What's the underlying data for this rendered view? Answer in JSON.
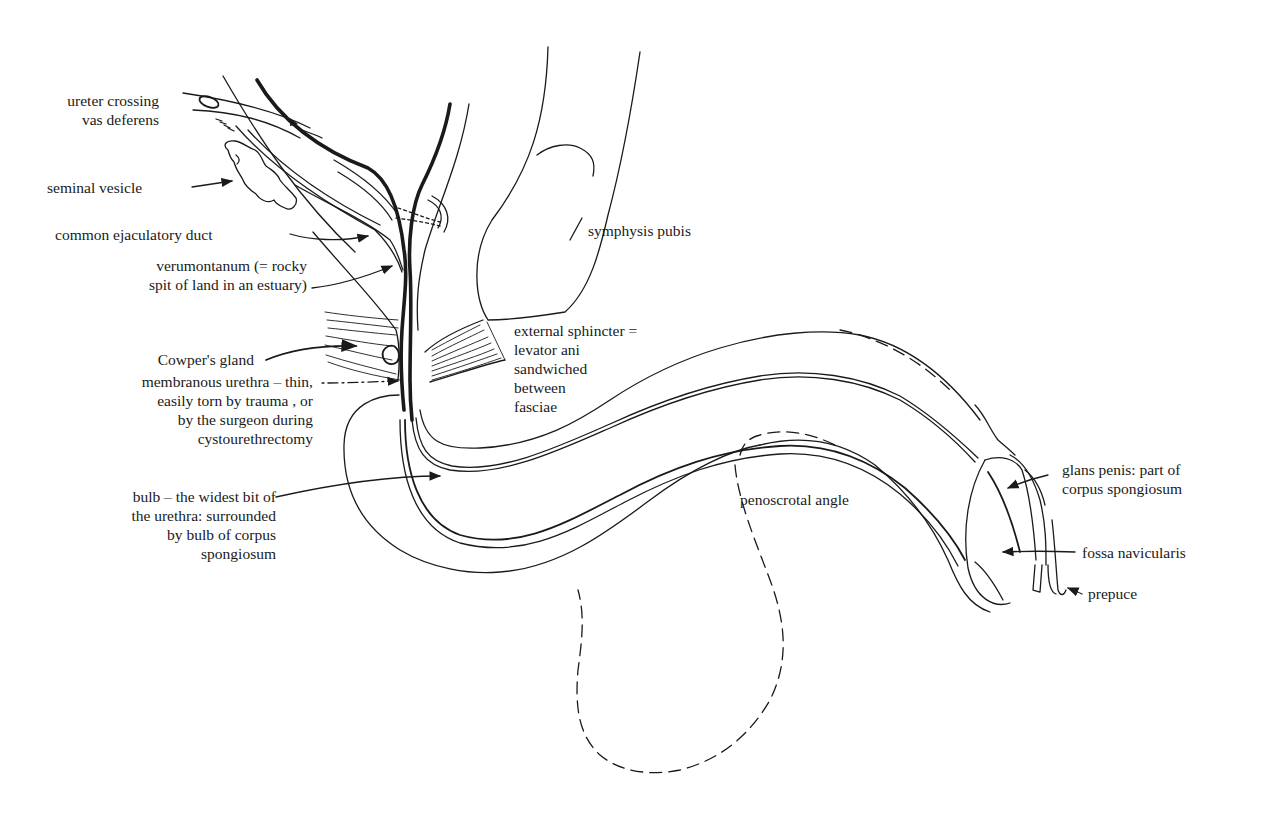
{
  "figure": {
    "labels": {
      "ureter_crossing": [
        "ureter crossing",
        "vas deferens"
      ],
      "seminal_vesicle": [
        "seminal vesicle"
      ],
      "common_ejaculatory_duct": [
        "common ejaculatory duct"
      ],
      "verumontanum": [
        "verumontanum (= rocky",
        "spit of land in an estuary)"
      ],
      "cowpers_gland": [
        "Cowper's gland"
      ],
      "membranous_urethra": [
        "membranous urethra – thin,",
        "easily torn by trauma , or",
        "by the surgeon during",
        "cystourethrectomy"
      ],
      "bulb": [
        "bulb – the widest bit of",
        "the urethra: surrounded",
        "by bulb of corpus",
        "spongiosum"
      ],
      "symphysis_pubis": [
        "symphysis pubis"
      ],
      "external_sphincter": [
        "external sphincter =",
        "levator ani",
        "sandwiched",
        "between",
        "fasciae"
      ],
      "penoscrotal_angle": [
        "penoscrotal angle"
      ],
      "glans_penis": [
        "glans penis: part of",
        "corpus spongiosum"
      ],
      "fossa_navicularis": [
        "fossa navicularis"
      ],
      "prepuce": [
        "prepuce"
      ]
    },
    "colors": {
      "ink": "#1a1a1a",
      "paper": "#ffffff"
    }
  }
}
